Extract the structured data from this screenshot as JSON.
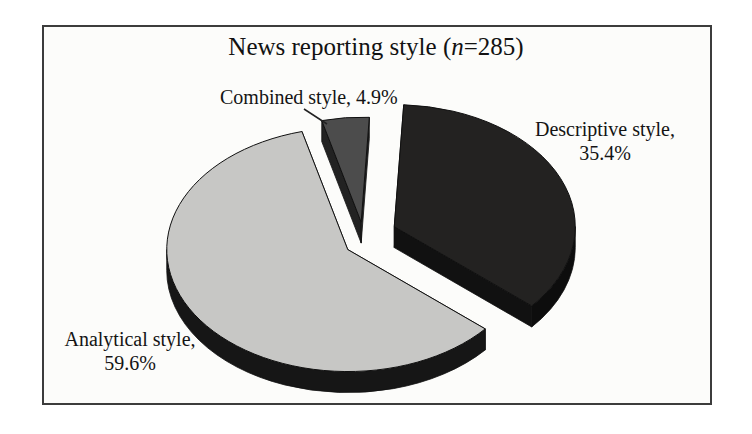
{
  "frame": {
    "border_color": "#3c3c3c",
    "background": "#fcfcfa"
  },
  "title": {
    "pre": "News reporting style (",
    "variable": "n",
    "post": "=285)"
  },
  "labels": {
    "combined": "Combined style, 4.9%",
    "descriptive_line1": "Descriptive style,",
    "descriptive_line2": "35.4%",
    "analytical_line1": "Analytical style,",
    "analytical_line2": "59.6%"
  },
  "chart_data": {
    "type": "pie",
    "style": "3d-exploded",
    "title": "News reporting style (n=285)",
    "sample_size": 285,
    "unit": "percent",
    "legend": "none",
    "categories": [
      "Descriptive style",
      "Analytical style",
      "Combined style"
    ],
    "values": [
      35.4,
      59.6,
      4.9
    ],
    "slices": [
      {
        "id": "descriptive",
        "name": "Descriptive style",
        "value": 35.4,
        "explode": 34,
        "rscale": 1,
        "top_color": "#232221",
        "side_color": "#0d0d0d",
        "cut_color": "#111111"
      },
      {
        "id": "analytical",
        "name": "Analytical style",
        "value": 59.6,
        "explode": 18,
        "rscale": 1,
        "top_color": "#c7c7c5",
        "side_color": "#161616",
        "cut_color": "#919191"
      },
      {
        "id": "combined",
        "name": "Combined style",
        "value": 4.9,
        "explode": 18,
        "rscale": 0.86,
        "top_color": "#4c4c4c",
        "side_color": "#1d1d1d",
        "cut_color": "#222222"
      }
    ],
    "layout": {
      "center_x": 363,
      "center_y": 240,
      "rx": 181,
      "ry": 122,
      "depth": 21,
      "start_angle_deg": 3,
      "clockwise": true,
      "outline_color": "#101010"
    },
    "leader_line": {
      "x1": 304,
      "y1": 109,
      "x2": 327,
      "y2": 124,
      "color": "#222222"
    }
  }
}
